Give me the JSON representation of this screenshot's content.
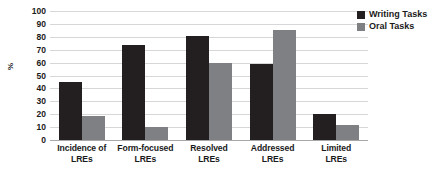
{
  "chart_data": {
    "type": "bar",
    "title": "",
    "xlabel": "",
    "ylabel": "%",
    "ylim": [
      0,
      100
    ],
    "ytick_step": 10,
    "yticks": [
      100,
      90,
      80,
      70,
      60,
      50,
      40,
      30,
      20,
      10,
      0
    ],
    "grid": true,
    "legend_position": "right-top",
    "categories": [
      "Incidence of LREs",
      "Form-focused LREs",
      "Resolved LREs",
      "Addressed LREs",
      "Limited LREs"
    ],
    "category_lines": [
      [
        "Incidence of",
        "LREs"
      ],
      [
        "Form-focused",
        "LREs"
      ],
      [
        "Resolved",
        "LREs"
      ],
      [
        "Addressed",
        "LREs"
      ],
      [
        "Limited",
        "LREs"
      ]
    ],
    "series": [
      {
        "name": "Writing Tasks",
        "color": "#231f20",
        "values": [
          45,
          74,
          81,
          59,
          20
        ]
      },
      {
        "name": "Oral Tasks",
        "color": "#7f8083",
        "values": [
          19,
          10,
          60,
          85,
          12
        ]
      }
    ]
  },
  "legend": {
    "items": [
      {
        "label": "Writing Tasks",
        "swatch": "writing-swatch"
      },
      {
        "label": "Oral Tasks",
        "swatch": "oral-swatch"
      }
    ]
  }
}
